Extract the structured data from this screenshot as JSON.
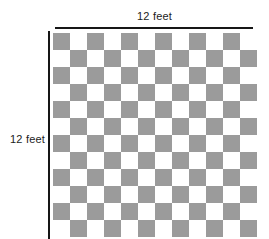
{
  "diagram": {
    "kind": "checkerboard-floor-plan",
    "title": "",
    "top_dimension_label": "12 feet",
    "left_dimension_label": "12 feet",
    "colors": {
      "tile_shaded": "#9b9b9b",
      "tile_light": "#ffffff",
      "rule_line": "#161616",
      "label_text": "#1c1c1c",
      "background": "#ffffff"
    },
    "grid": {
      "columns": 12,
      "rows": 12,
      "cell_size_px": 17,
      "pattern": "alternating checkerboard, top-left tile shaded",
      "shaded_tile_count": 72,
      "light_tile_count": 72
    },
    "measurements": {
      "width_value": 12,
      "height_value": 12,
      "unit": "feet"
    }
  },
  "chart_data": {
    "type": "heatmap",
    "title": "",
    "xlabel": "12 feet",
    "ylabel": "12 feet",
    "categories": [
      "1",
      "2",
      "3",
      "4",
      "5",
      "6",
      "7",
      "8",
      "9",
      "10",
      "11",
      "12"
    ],
    "grid": true,
    "legend": "none",
    "values": [
      [
        1,
        0,
        1,
        0,
        1,
        0,
        1,
        0,
        1,
        0,
        1,
        0
      ],
      [
        0,
        1,
        0,
        1,
        0,
        1,
        0,
        1,
        0,
        1,
        0,
        1
      ],
      [
        1,
        0,
        1,
        0,
        1,
        0,
        1,
        0,
        1,
        0,
        1,
        0
      ],
      [
        0,
        1,
        0,
        1,
        0,
        1,
        0,
        1,
        0,
        1,
        0,
        1
      ],
      [
        1,
        0,
        1,
        0,
        1,
        0,
        1,
        0,
        1,
        0,
        1,
        0
      ],
      [
        0,
        1,
        0,
        1,
        0,
        1,
        0,
        1,
        0,
        1,
        0,
        1
      ],
      [
        1,
        0,
        1,
        0,
        1,
        0,
        1,
        0,
        1,
        0,
        1,
        0
      ],
      [
        0,
        1,
        0,
        1,
        0,
        1,
        0,
        1,
        0,
        1,
        0,
        1
      ],
      [
        1,
        0,
        1,
        0,
        1,
        0,
        1,
        0,
        1,
        0,
        1,
        0
      ],
      [
        0,
        1,
        0,
        1,
        0,
        1,
        0,
        1,
        0,
        1,
        0,
        1
      ],
      [
        1,
        0,
        1,
        0,
        1,
        0,
        1,
        0,
        1,
        0,
        1,
        0
      ],
      [
        0,
        1,
        0,
        1,
        0,
        1,
        0,
        1,
        0,
        1,
        0,
        1
      ]
    ]
  }
}
